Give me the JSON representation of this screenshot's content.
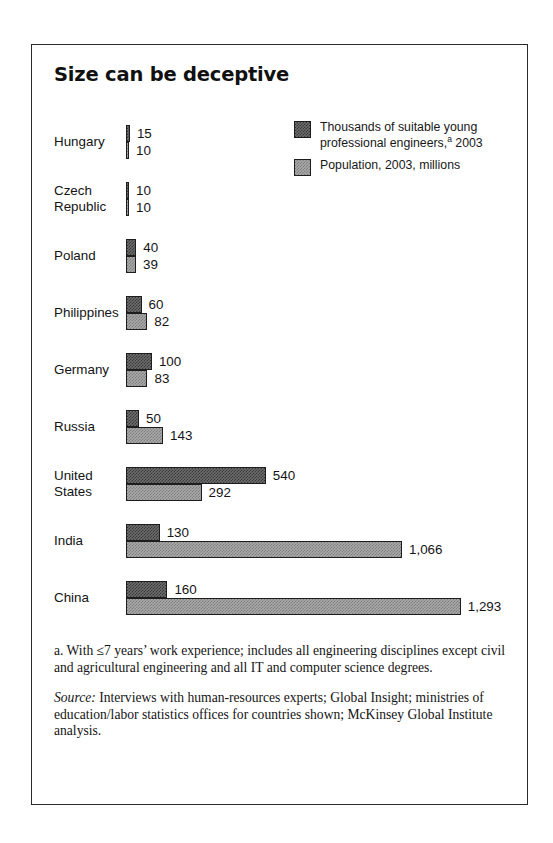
{
  "exhibit": {
    "title": "Size can be deceptive",
    "legend": [
      {
        "key": "engineers",
        "label_line1": "Thousands of suitable young",
        "label_line2_pre": "professional engineers,",
        "label_superscript": "a",
        "label_line2_post": " 2003",
        "swatch": "dark-hatched-square-icon",
        "color": "#6e6e6e"
      },
      {
        "key": "population",
        "label_line1": "Population, 2003, millions",
        "swatch": "light-hatched-square-icon",
        "color": "#a9a9a9"
      }
    ],
    "footnote": "a. With ≤7 years’ work experience; includes all engineering disciplines except civil and agricultural engineering and all IT and computer science degrees.",
    "source_label": "Source:",
    "source_text": " Interviews with human-resources experts; Global Insight; ministries of education/labor statistics offices for countries shown; McKinsey Global Institute analysis."
  },
  "chart_data": {
    "type": "bar",
    "title": "Size can be deceptive",
    "orientation": "horizontal",
    "grid": false,
    "legend_position": "top-right",
    "xlabel": "",
    "ylabel": "",
    "xlim": [
      0,
      1293
    ],
    "px_per_unit": 0.2589,
    "bar_origin_px": 94,
    "categories": [
      "Hungary",
      "Czech Republic",
      "Poland",
      "Philippines",
      "Germany",
      "Russia",
      "United States",
      "India",
      "China"
    ],
    "series": [
      {
        "name": "Thousands of suitable young professional engineers, 2003",
        "color": "#6e6e6e",
        "values": [
          15,
          10,
          40,
          60,
          100,
          50,
          540,
          130,
          160
        ],
        "labels": [
          "15",
          "10",
          "40",
          "60",
          "100",
          "50",
          "540",
          "130",
          "160"
        ]
      },
      {
        "name": "Population, 2003, millions",
        "color": "#a9a9a9",
        "values": [
          10,
          10,
          39,
          82,
          83,
          143,
          292,
          1066,
          1293
        ],
        "labels": [
          "10",
          "10",
          "39",
          "82",
          "83",
          "143",
          "292",
          "1,066",
          "1,293"
        ]
      }
    ],
    "rows": [
      {
        "label": "Hungary",
        "label_lines": "Hungary",
        "y": 80,
        "engineers": 15,
        "engineers_label": "15",
        "population": 10,
        "population_label": "10"
      },
      {
        "label": "Czech Republic",
        "label_lines": "Czech\nRepublic",
        "y": 137,
        "engineers": 10,
        "engineers_label": "10",
        "population": 10,
        "population_label": "10"
      },
      {
        "label": "Poland",
        "label_lines": "Poland",
        "y": 194,
        "engineers": 40,
        "engineers_label": "40",
        "population": 39,
        "population_label": "39"
      },
      {
        "label": "Philippines",
        "label_lines": "Philippines",
        "y": 251,
        "engineers": 60,
        "engineers_label": "60",
        "population": 82,
        "population_label": "82"
      },
      {
        "label": "Germany",
        "label_lines": "Germany",
        "y": 308,
        "engineers": 100,
        "engineers_label": "100",
        "population": 83,
        "population_label": "83"
      },
      {
        "label": "Russia",
        "label_lines": "Russia",
        "y": 365,
        "engineers": 50,
        "engineers_label": "50",
        "population": 143,
        "population_label": "143"
      },
      {
        "label": "United States",
        "label_lines": "United\nStates",
        "y": 422,
        "engineers": 540,
        "engineers_label": "540",
        "population": 292,
        "population_label": "292"
      },
      {
        "label": "India",
        "label_lines": "India",
        "y": 479,
        "engineers": 130,
        "engineers_label": "130",
        "population": 1066,
        "population_label": "1,066"
      },
      {
        "label": "China",
        "label_lines": "China",
        "y": 536,
        "engineers": 160,
        "engineers_label": "160",
        "population": 1293,
        "population_label": "1,293"
      }
    ]
  }
}
